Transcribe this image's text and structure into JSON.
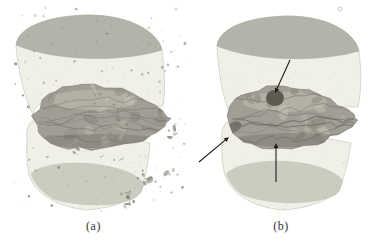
{
  "figure": {
    "title": "",
    "panels": [
      {
        "id": "a",
        "label": "(a)",
        "debris": true,
        "annotations": []
      },
      {
        "id": "b",
        "label": "(b)",
        "debris": false,
        "annotations": [
          {
            "name": "annotation-arrow-upper",
            "from": [
              103,
              60
            ],
            "to": [
              88,
              93
            ]
          },
          {
            "name": "annotation-arrow-left",
            "from": [
              12,
              162
            ],
            "to": [
              42,
              137
            ]
          },
          {
            "name": "annotation-arrow-bottom",
            "from": [
              89,
              182
            ],
            "to": [
              89,
              143
            ]
          }
        ]
      }
    ],
    "colors": {
      "background": "#ffffff",
      "body": "#f1f0e8",
      "body_edge": "#cfcfc3",
      "top_cap": "#b3b3a9",
      "top_cap_edge": "#a4a499",
      "bottom_cap": "#c6c6bb",
      "fracture_base": "#a19e95",
      "fracture_light": "#c2bfb3",
      "fracture_mid": "#8b887e",
      "fracture_dark": "#6b685f",
      "fracture_outline": "#7d7a71",
      "dark_spot": "#59564c",
      "debris": [
        "#8d8d83",
        "#9a9a90",
        "#7f7f76",
        "#a6a69c"
      ],
      "arrow": "#1c1c1c",
      "label_text": "#333333"
    }
  }
}
